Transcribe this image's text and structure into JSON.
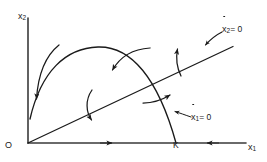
{
  "figure": {
    "type": "phase-plane-diagram",
    "background_color": "#ffffff",
    "stroke_color": "#1a1a1a"
  },
  "axes": {
    "y_axis": {
      "name": "vertical-axis",
      "label_base": "x",
      "label_sub": "2",
      "x": 28,
      "y_top": 18,
      "y_bottom": 143
    },
    "x_axis": {
      "name": "horizontal-axis",
      "label_base": "x",
      "label_sub": "1",
      "y": 143,
      "x_left": 28,
      "x_right": 246
    },
    "origin_label": "O"
  },
  "points": {
    "K": {
      "label": "K",
      "x": 176,
      "y": 143,
      "description": "carrying capacity on x1 axis where the x1-nullcline meets the axis"
    }
  },
  "nullclines": [
    {
      "name": "x2-nullcline",
      "label_base": "x",
      "label_sub": "2",
      "label_eq": "= 0",
      "shape": "straight-line",
      "from": [
        28,
        143
      ],
      "to": [
        232,
        47
      ],
      "annotation_arrow": {
        "from": [
          222,
          33
        ],
        "to": [
          205,
          46
        ]
      }
    },
    {
      "name": "x1-nullcline",
      "label_base": "x",
      "label_sub": "1",
      "label_eq": "= 0",
      "shape": "concave-arc",
      "from": [
        30,
        118
      ],
      "apex": [
        100,
        48
      ],
      "to": [
        176,
        143
      ],
      "annotation_arrow": {
        "from": [
          190,
          116
        ],
        "to": [
          174,
          111
        ]
      }
    }
  ],
  "flow_arrows": [
    {
      "name": "flow-arrow-left-down",
      "direction": "down",
      "near": [
        36,
        100
      ]
    },
    {
      "name": "flow-arrow-upper-middle",
      "direction": "down-left",
      "near": [
        112,
        75
      ]
    },
    {
      "name": "flow-arrow-lower-middle",
      "direction": "down-right",
      "near": [
        92,
        122
      ]
    },
    {
      "name": "flow-arrow-right-up",
      "direction": "up",
      "near": [
        178,
        48
      ]
    },
    {
      "name": "flow-arrow-near-k",
      "direction": "up-right",
      "near": [
        172,
        96
      ]
    },
    {
      "name": "axis-arrow-right",
      "direction": "right",
      "near": [
        112,
        143
      ]
    },
    {
      "name": "axis-arrow-left",
      "direction": "left",
      "near": [
        208,
        143
      ]
    }
  ]
}
